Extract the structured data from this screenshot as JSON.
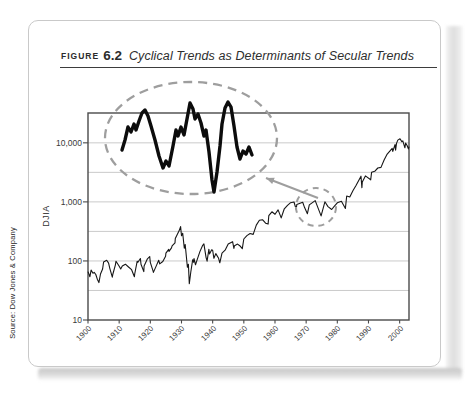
{
  "figure": {
    "label": "FIGURE",
    "number": "6.2",
    "title": "Cyclical Trends as Determinants of Secular Trends"
  },
  "source": "Source: Dow Jones & Company",
  "colors": {
    "line": "#161616",
    "inset_line": "#0c0c0c",
    "grid": "#c4c4c4",
    "plot_border": "#4a4a4a",
    "annotation_gray": "#9e9e9e",
    "card_border": "#c9c9c9"
  },
  "chart_data": {
    "type": "line",
    "title": "Cyclical Trends as Determinants of Secular Trends",
    "xlabel": "",
    "ylabel": "DJIA",
    "y_scale": "log",
    "xlim": [
      1900,
      2003
    ],
    "ylim": [
      10,
      32000
    ],
    "grid": "horizontal lines at every half decade of the log scale",
    "legend": "none",
    "x_ticks": [
      1900,
      1910,
      1920,
      1930,
      1940,
      1950,
      1960,
      1970,
      1980,
      1990,
      2000
    ],
    "y_ticks": [
      {
        "label": "10,000",
        "value": 10000
      },
      {
        "label": "1,000",
        "value": 1000
      },
      {
        "label": "100",
        "value": 100
      },
      {
        "label": "10",
        "value": 10
      }
    ],
    "gridline_values": [
      31.62,
      100,
      316.2,
      1000,
      3162,
      10000
    ],
    "series": [
      {
        "name": "DJIA",
        "points": [
          [
            1900,
            66
          ],
          [
            1900.6,
            54
          ],
          [
            1901,
            70
          ],
          [
            1901.6,
            62
          ],
          [
            1902,
            64
          ],
          [
            1902.5,
            59
          ],
          [
            1903,
            49
          ],
          [
            1903.5,
            43
          ],
          [
            1904,
            60
          ],
          [
            1904.7,
            73
          ],
          [
            1905,
            96
          ],
          [
            1906,
            103
          ],
          [
            1906.6,
            92
          ],
          [
            1907,
            75
          ],
          [
            1907.8,
            53
          ],
          [
            1908,
            60
          ],
          [
            1908.8,
            86
          ],
          [
            1909,
            99
          ],
          [
            1910,
            81
          ],
          [
            1910.5,
            73
          ],
          [
            1911,
            82
          ],
          [
            1912,
            88
          ],
          [
            1913,
            79
          ],
          [
            1914,
            71
          ],
          [
            1914.9,
            54
          ],
          [
            1915,
            60
          ],
          [
            1915.8,
            99
          ],
          [
            1916,
            95
          ],
          [
            1916.8,
            110
          ],
          [
            1917,
            88
          ],
          [
            1917.9,
            66
          ],
          [
            1918,
            82
          ],
          [
            1919,
            107
          ],
          [
            1919.8,
            119
          ],
          [
            1920,
            95
          ],
          [
            1920.9,
            67
          ],
          [
            1921,
            64
          ],
          [
            1922,
            85
          ],
          [
            1922.7,
            103
          ],
          [
            1923,
            89
          ],
          [
            1924,
            98
          ],
          [
            1924.9,
            120
          ],
          [
            1925,
            135
          ],
          [
            1925.9,
            157
          ],
          [
            1926,
            145
          ],
          [
            1926.8,
            166
          ],
          [
            1927,
            180
          ],
          [
            1927.9,
            202
          ],
          [
            1928,
            240
          ],
          [
            1928.9,
            300
          ],
          [
            1929.2,
            320
          ],
          [
            1929.7,
            381
          ],
          [
            1930,
            267
          ],
          [
            1930.4,
            294
          ],
          [
            1930.9,
            164
          ],
          [
            1931.2,
            190
          ],
          [
            1931.9,
            78
          ],
          [
            1932.2,
            88
          ],
          [
            1932.5,
            41
          ],
          [
            1933,
            65
          ],
          [
            1933.6,
            105
          ],
          [
            1933.9,
            95
          ],
          [
            1934,
            110
          ],
          [
            1934.5,
            86
          ],
          [
            1935,
            104
          ],
          [
            1935.9,
            144
          ],
          [
            1936.8,
            184
          ],
          [
            1937.2,
            194
          ],
          [
            1937.9,
            114
          ],
          [
            1938.2,
            99
          ],
          [
            1938.8,
            158
          ],
          [
            1939,
            131
          ],
          [
            1939.7,
            155
          ],
          [
            1940,
            150
          ],
          [
            1940.4,
            111
          ],
          [
            1941,
            133
          ],
          [
            1941.9,
            111
          ],
          [
            1942.3,
            93
          ],
          [
            1943,
            136
          ],
          [
            1944,
            152
          ],
          [
            1945,
            193
          ],
          [
            1946.4,
            212
          ],
          [
            1946.8,
            163
          ],
          [
            1947,
            181
          ],
          [
            1948,
            193
          ],
          [
            1948.9,
            177
          ],
          [
            1949.5,
            161
          ],
          [
            1950,
            235
          ],
          [
            1951,
            269
          ],
          [
            1952,
            292
          ],
          [
            1953,
            281
          ],
          [
            1954,
            404
          ],
          [
            1955,
            488
          ],
          [
            1956,
            499
          ],
          [
            1957,
            436
          ],
          [
            1957.8,
            420
          ],
          [
            1958,
            584
          ],
          [
            1959,
            679
          ],
          [
            1960,
            616
          ],
          [
            1961,
            731
          ],
          [
            1962,
            535
          ],
          [
            1963,
            763
          ],
          [
            1964,
            874
          ],
          [
            1965,
            969
          ],
          [
            1966.1,
            995
          ],
          [
            1966.8,
            744
          ],
          [
            1967,
            905
          ],
          [
            1968.9,
            985
          ],
          [
            1969.5,
            800
          ],
          [
            1970.4,
            631
          ],
          [
            1971,
            890
          ],
          [
            1972.9,
            1052
          ],
          [
            1974.8,
            578
          ],
          [
            1976,
            1005
          ],
          [
            1977,
            831
          ],
          [
            1978.2,
            742
          ],
          [
            1979,
            839
          ],
          [
            1980,
            964
          ],
          [
            1981.3,
            1024
          ],
          [
            1982.6,
            777
          ],
          [
            1983,
            1259
          ],
          [
            1984,
            1212
          ],
          [
            1985,
            1547
          ],
          [
            1986,
            1896
          ],
          [
            1987.6,
            2722
          ],
          [
            1987.9,
            1739
          ],
          [
            1988,
            2169
          ],
          [
            1989,
            2753
          ],
          [
            1990.7,
            2365
          ],
          [
            1991,
            3169
          ],
          [
            1992,
            3301
          ],
          [
            1993,
            3754
          ],
          [
            1994,
            3834
          ],
          [
            1995,
            5117
          ],
          [
            1996,
            6448
          ],
          [
            1997.6,
            8038
          ],
          [
            1997.8,
            7161
          ],
          [
            1998.5,
            9338
          ],
          [
            1998.7,
            7539
          ],
          [
            1999,
            9800
          ],
          [
            1999.4,
            11107
          ],
          [
            2000.1,
            11723
          ],
          [
            2000.7,
            10500
          ],
          [
            2001,
            10800
          ],
          [
            2001.7,
            8236
          ],
          [
            2001.9,
            9900
          ],
          [
            2002.4,
            9000
          ],
          [
            2002.8,
            7900
          ],
          [
            2003,
            8600
          ]
        ]
      }
    ],
    "annotations": {
      "highlighted_region": {
        "description": "Small dashed ellipse around the 1966-1980 sideways cyclical swings near DJIA 1,000",
        "ellipse_px": {
          "cx": 316,
          "cy": 207,
          "rx": 20,
          "ry": 19
        }
      },
      "magnifier": {
        "description": "Large dashed ellipse showing the highlighted cyclical swings magnified as a bold zigzag line",
        "ellipse_px": {
          "cx": 191,
          "cy": 138,
          "rx": 86,
          "ry": 56
        },
        "inset_line_px": [
          [
            122,
            150
          ],
          [
            125,
            140
          ],
          [
            128,
            127
          ],
          [
            131,
            132
          ],
          [
            134,
            124
          ],
          [
            136,
            130
          ],
          [
            139,
            121
          ],
          [
            142,
            113
          ],
          [
            145,
            110
          ],
          [
            148,
            116
          ],
          [
            151,
            126
          ],
          [
            155,
            140
          ],
          [
            159,
            156
          ],
          [
            163,
            168
          ],
          [
            166,
            161
          ],
          [
            169,
            166
          ],
          [
            173,
            146
          ],
          [
            176,
            130
          ],
          [
            178,
            136
          ],
          [
            181,
            127
          ],
          [
            184,
            135
          ],
          [
            187,
            119
          ],
          [
            190,
            103
          ],
          [
            193,
            109
          ],
          [
            195,
            119
          ],
          [
            198,
            114
          ],
          [
            201,
            123
          ],
          [
            204,
            136
          ],
          [
            206,
            130
          ],
          [
            209,
            152
          ],
          [
            212,
            180
          ],
          [
            214,
            192
          ],
          [
            217,
            172
          ],
          [
            220,
            146
          ],
          [
            222,
            124
          ],
          [
            225,
            108
          ],
          [
            228,
            102
          ],
          [
            231,
            107
          ],
          [
            234,
            126
          ],
          [
            237,
            147
          ],
          [
            240,
            159
          ],
          [
            243,
            151
          ],
          [
            246,
            154
          ],
          [
            249,
            147
          ],
          [
            252,
            155
          ]
        ]
      },
      "callout_arrow_px": {
        "tail": [
          318,
          198
        ],
        "tip": [
          266,
          178
        ]
      }
    },
    "plot_area_px": {
      "left": 88,
      "top": 113,
      "right": 409,
      "bottom": 320
    }
  }
}
